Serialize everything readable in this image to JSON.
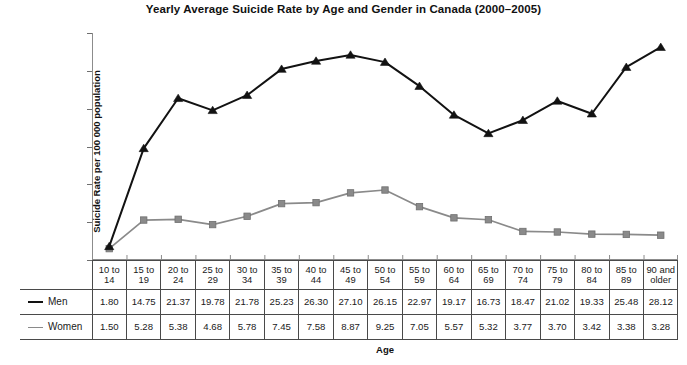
{
  "chart_data": {
    "type": "line",
    "title": "Yearly Average Suicide Rate by Age and Gender in Canada (2000–2005)",
    "xlabel": "Age",
    "ylabel": "Suicide Rate per 100 000 population",
    "ylim": [
      0,
      30
    ],
    "ytick_step": 5,
    "ytick_labels": [
      "0.00",
      "5.00",
      "10.00",
      "15.00",
      "20.00",
      "25.00",
      "30.00"
    ],
    "grid": false,
    "legend_position": "table-left",
    "categories": [
      "10 to 14",
      "15 to 19",
      "20 to 24",
      "25 to 29",
      "30 to 34",
      "35 to 39",
      "40 to 44",
      "45 to 49",
      "50 to 54",
      "55 to 59",
      "60 to 64",
      "65 to 69",
      "70 to 74",
      "75 to 79",
      "80 to 84",
      "85 to 89",
      "90 and older"
    ],
    "series": [
      {
        "name": "Men",
        "color": "#121212",
        "marker": "triangle",
        "values": [
          1.8,
          14.75,
          21.37,
          19.78,
          21.78,
          25.23,
          26.3,
          27.1,
          26.15,
          22.97,
          19.17,
          16.73,
          18.47,
          21.02,
          19.33,
          25.48,
          28.12
        ]
      },
      {
        "name": "Women",
        "color": "#8a8a8a",
        "marker": "square",
        "values": [
          1.5,
          5.28,
          5.38,
          4.68,
          5.78,
          7.45,
          7.58,
          8.87,
          9.25,
          7.05,
          5.57,
          5.32,
          3.77,
          3.7,
          3.42,
          3.38,
          3.28
        ]
      }
    ]
  },
  "table": {
    "age_headers": [
      [
        "10 to",
        "14"
      ],
      [
        "15 to",
        "19"
      ],
      [
        "20 to",
        "24"
      ],
      [
        "25 to",
        "29"
      ],
      [
        "30 to",
        "34"
      ],
      [
        "35 to",
        "39"
      ],
      [
        "40 to",
        "44"
      ],
      [
        "45 to",
        "49"
      ],
      [
        "50 to",
        "54"
      ],
      [
        "55 to",
        "59"
      ],
      [
        "60 to",
        "64"
      ],
      [
        "65 to",
        "69"
      ],
      [
        "70 to",
        "74"
      ],
      [
        "75 to",
        "79"
      ],
      [
        "80 to",
        "84"
      ],
      [
        "85 to",
        "89"
      ],
      [
        "90 and",
        "older"
      ]
    ],
    "rows": [
      {
        "label": "Men",
        "swatch": "men",
        "values": [
          "1.80",
          "14.75",
          "21.37",
          "19.78",
          "21.78",
          "25.23",
          "26.30",
          "27.10",
          "26.15",
          "22.97",
          "19.17",
          "16.73",
          "18.47",
          "21.02",
          "19.33",
          "25.48",
          "28.12"
        ]
      },
      {
        "label": "Women",
        "swatch": "women",
        "values": [
          "1.50",
          "5.28",
          "5.38",
          "4.68",
          "5.78",
          "7.45",
          "7.58",
          "8.87",
          "9.25",
          "7.05",
          "5.57",
          "5.32",
          "3.77",
          "3.70",
          "3.42",
          "3.38",
          "3.28"
        ]
      }
    ]
  },
  "colors": {
    "men_line": "#121212",
    "women_line": "#8a8a8a",
    "axis": "#8c8c8c",
    "table_border": "#4a4a4a",
    "text": "#1a1a1a"
  }
}
